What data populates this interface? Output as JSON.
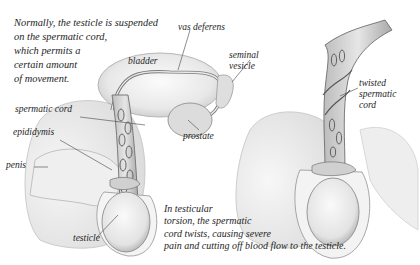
{
  "figure": {
    "caption_normal": [
      "Normally, the testicle is suspended",
      "on the spermatic cord,",
      "which permits a",
      "certain amount",
      "of movement."
    ],
    "caption_torsion": [
      "In testicular",
      "torsion, the spermatic",
      "cord twists, causing severe",
      "pain and cutting off blood flow to the testicle."
    ],
    "labels": {
      "bladder": "bladder",
      "vas_deferens": "vas deferens",
      "seminal_vesicle_1": "seminal",
      "seminal_vesicle_2": "vesicle",
      "spermatic_cord": "spermatic cord",
      "epididymis": "epididymis",
      "penis": "penis",
      "prostate": "prostate",
      "testicle": "testicle",
      "twisted_1": "twisted",
      "twisted_2": "spermatic",
      "twisted_3": "cord"
    },
    "colors": {
      "ink": "#1e1e1e",
      "tissue_light": "#eeeeee",
      "tissue_mid": "#d6d6d6",
      "tissue_dark": "#8a8a8a",
      "leader": "#444444"
    }
  }
}
